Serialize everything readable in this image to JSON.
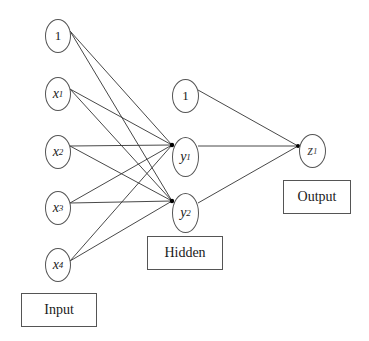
{
  "diagram": {
    "type": "neural-network",
    "layers": [
      {
        "name": "input",
        "label": "Input",
        "nodes": [
          {
            "id": "in_bias",
            "base": "1",
            "sub": "",
            "bias": true
          },
          {
            "id": "x1",
            "base": "x",
            "sub": "1",
            "bias": false
          },
          {
            "id": "x2",
            "base": "x",
            "sub": "2",
            "bias": false
          },
          {
            "id": "x3",
            "base": "x",
            "sub": "3",
            "bias": false
          },
          {
            "id": "x4",
            "base": "x",
            "sub": "4",
            "bias": false
          }
        ]
      },
      {
        "name": "hidden",
        "label": "Hidden",
        "nodes": [
          {
            "id": "h_bias",
            "base": "1",
            "sub": "",
            "bias": true
          },
          {
            "id": "y1",
            "base": "y",
            "sub": "1",
            "bias": false
          },
          {
            "id": "y2",
            "base": "y",
            "sub": "2",
            "bias": false
          }
        ]
      },
      {
        "name": "output",
        "label": "Output",
        "nodes": [
          {
            "id": "z1",
            "base": "z",
            "sub": "1",
            "bias": false
          }
        ]
      }
    ],
    "edges": [
      [
        "in_bias",
        "y1"
      ],
      [
        "in_bias",
        "y2"
      ],
      [
        "x1",
        "y1"
      ],
      [
        "x1",
        "y2"
      ],
      [
        "x2",
        "y1"
      ],
      [
        "x2",
        "y2"
      ],
      [
        "x3",
        "y1"
      ],
      [
        "x3",
        "y2"
      ],
      [
        "x4",
        "y1"
      ],
      [
        "x4",
        "y2"
      ],
      [
        "h_bias",
        "z1"
      ],
      [
        "y1",
        "z1"
      ],
      [
        "y2",
        "z1"
      ]
    ],
    "colors": {
      "line": "#333333",
      "border": "#555555",
      "background": "#ffffff"
    }
  }
}
